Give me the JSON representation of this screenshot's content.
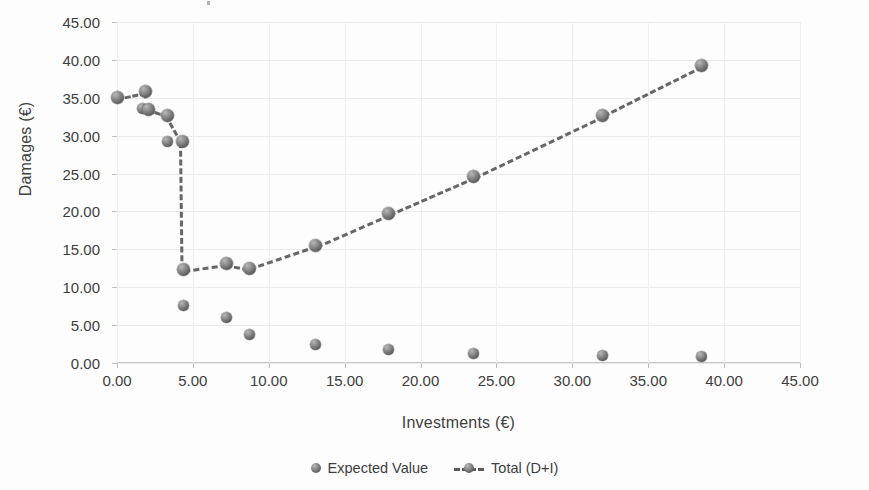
{
  "chart_data": {
    "type": "scatter",
    "title": "",
    "xlabel": "Investments (€)",
    "ylabel": "Damages (€)",
    "xlim": [
      0,
      45
    ],
    "ylim": [
      0,
      45
    ],
    "xticks": [
      "0.00",
      "5.00",
      "10.00",
      "15.00",
      "20.00",
      "25.00",
      "30.00",
      "35.00",
      "40.00",
      "45.00"
    ],
    "yticks": [
      "0.00",
      "5.00",
      "10.00",
      "15.00",
      "20.00",
      "25.00",
      "30.00",
      "35.00",
      "40.00",
      "45.00"
    ],
    "xtick_values": [
      0,
      5,
      10,
      15,
      20,
      25,
      30,
      35,
      40,
      45
    ],
    "ytick_values": [
      0,
      5,
      10,
      15,
      20,
      25,
      30,
      35,
      40,
      45
    ],
    "grid": true,
    "legend_position": "bottom",
    "marker_color": "#6a6a6a",
    "line_color": "#5a5a5a",
    "series": [
      {
        "name": "Expected Value",
        "style": "markers",
        "points": [
          {
            "x": 0.0,
            "y": 35.0
          },
          {
            "x": 1.7,
            "y": 33.6
          },
          {
            "x": 2.1,
            "y": 33.5
          },
          {
            "x": 3.3,
            "y": 29.2
          },
          {
            "x": 4.4,
            "y": 7.6
          },
          {
            "x": 7.2,
            "y": 6.0
          },
          {
            "x": 8.7,
            "y": 3.8
          },
          {
            "x": 13.1,
            "y": 2.4
          },
          {
            "x": 17.9,
            "y": 1.8
          },
          {
            "x": 23.5,
            "y": 1.3
          },
          {
            "x": 32.0,
            "y": 1.0
          },
          {
            "x": 38.5,
            "y": 0.8
          }
        ]
      },
      {
        "name": "Total (D+I)",
        "style": "dashed-line-markers",
        "points": [
          {
            "x": 0.0,
            "y": 35.0
          },
          {
            "x": 1.9,
            "y": 35.8
          },
          {
            "x": 2.1,
            "y": 33.5
          },
          {
            "x": 3.3,
            "y": 32.7
          },
          {
            "x": 4.3,
            "y": 29.2
          },
          {
            "x": 4.4,
            "y": 12.3
          },
          {
            "x": 7.2,
            "y": 13.1
          },
          {
            "x": 8.7,
            "y": 12.5
          },
          {
            "x": 13.1,
            "y": 15.5
          },
          {
            "x": 17.9,
            "y": 19.7
          },
          {
            "x": 23.5,
            "y": 24.6
          },
          {
            "x": 32.0,
            "y": 32.7
          },
          {
            "x": 38.5,
            "y": 39.2
          }
        ]
      }
    ]
  },
  "legend": {
    "items": [
      {
        "label": "Expected Value"
      },
      {
        "label": "Total (D+I)"
      }
    ]
  }
}
